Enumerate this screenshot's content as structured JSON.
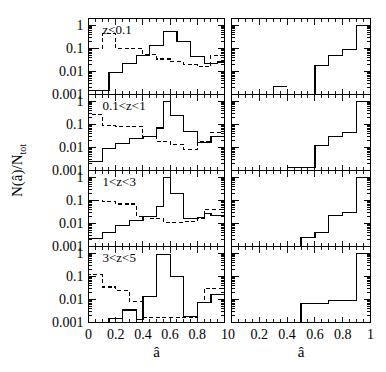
{
  "figure": {
    "xlabel_left": "â",
    "xlabel_right": "â",
    "ylabel": "N(â)/N",
    "ylabel_sub": "tot",
    "xticklabels": [
      "0",
      "0.2",
      "0.4",
      "0.6",
      "0.8",
      "1"
    ],
    "yticklabels": [
      "1",
      "0.1",
      "0.01",
      "0.001"
    ],
    "line_color": "#000000"
  },
  "chart_data": {
    "type": "line",
    "title": "",
    "xlabel": "â",
    "ylabel": "N(â)/N_tot",
    "xlim": [
      0,
      1
    ],
    "ylim": [
      0.001,
      2
    ],
    "yscale": "log",
    "grid": false,
    "legend": "none",
    "panels": [
      {
        "row": 0,
        "label": "z<0.1",
        "left": {
          "bin_edges": [
            0,
            0.05,
            0.1,
            0.15,
            0.2,
            0.25,
            0.3,
            0.35,
            0.4,
            0.45,
            0.5,
            0.55,
            0.6,
            0.65,
            0.7,
            0.75,
            0.8,
            0.85,
            0.9,
            0.95,
            1.0
          ],
          "series": [
            {
              "name": "solid",
              "style": "solid",
              "values": [
                0.0015,
                0.0015,
                0.0015,
                0.009,
                0.009,
                0.022,
                0.022,
                0.05,
                0.05,
                0.13,
                0.13,
                0.55,
                0.55,
                0.2,
                0.2,
                0.045,
                0.045,
                0.022,
                0.022,
                0.026
              ]
            },
            {
              "name": "dashed",
              "style": "dashed",
              "values": [
                0.1,
                0.1,
                0.45,
                0.45,
                0.1,
                0.1,
                0.1,
                0.1,
                0.055,
                0.055,
                0.035,
                0.035,
                0.026,
                0.026,
                0.02,
                0.02,
                0.016,
                0.016,
                0.05,
                0.05
              ]
            }
          ]
        },
        "right": {
          "bin_edges": [
            0,
            0.1,
            0.2,
            0.3,
            0.4,
            0.5,
            0.6,
            0.7,
            0.8,
            0.9,
            1.0
          ],
          "series": [
            {
              "name": "solid",
              "style": "solid",
              "values": [
                null,
                null,
                null,
                0.0022,
                null,
                null,
                0.018,
                0.05,
                0.09,
                1.0
              ]
            }
          ]
        }
      },
      {
        "row": 1,
        "label": "0.1<z<1",
        "left": {
          "bin_edges": [
            0,
            0.05,
            0.1,
            0.15,
            0.2,
            0.25,
            0.3,
            0.35,
            0.4,
            0.45,
            0.5,
            0.55,
            0.6,
            0.65,
            0.7,
            0.75,
            0.8,
            0.85,
            0.9,
            0.95,
            1.0
          ],
          "series": [
            {
              "name": "solid",
              "style": "solid",
              "values": [
                0.0025,
                0.0025,
                0.009,
                0.009,
                0.015,
                0.015,
                0.025,
                0.025,
                0.03,
                0.03,
                0.07,
                1.0,
                0.25,
                0.25,
                0.05,
                0.05,
                0.016,
                0.016,
                0.03,
                0.03
              ]
            },
            {
              "name": "dashed",
              "style": "dashed",
              "values": [
                0.28,
                0.28,
                0.09,
                0.09,
                0.085,
                0.085,
                0.085,
                0.085,
                0.03,
                0.03,
                0.018,
                0.018,
                0.013,
                0.013,
                0.008,
                0.008,
                0.018,
                0.018,
                0.045,
                0.045
              ]
            }
          ]
        },
        "right": {
          "bin_edges": [
            0,
            0.1,
            0.2,
            0.3,
            0.4,
            0.5,
            0.6,
            0.7,
            0.8,
            0.9,
            1.0
          ],
          "series": [
            {
              "name": "solid",
              "style": "solid",
              "values": [
                null,
                null,
                null,
                null,
                0.0013,
                0.0013,
                0.012,
                0.03,
                0.045,
                1.0
              ]
            }
          ]
        }
      },
      {
        "row": 2,
        "label": "1<z<3",
        "left": {
          "bin_edges": [
            0,
            0.05,
            0.1,
            0.15,
            0.2,
            0.25,
            0.3,
            0.35,
            0.4,
            0.45,
            0.5,
            0.55,
            0.6,
            0.65,
            0.7,
            0.75,
            0.8,
            0.85,
            0.9,
            0.95,
            1.0
          ],
          "series": [
            {
              "name": "solid",
              "style": "solid",
              "values": [
                0.0022,
                0.0022,
                0.004,
                0.004,
                0.008,
                0.008,
                0.013,
                0.013,
                0.02,
                0.02,
                0.055,
                1.0,
                0.2,
                0.2,
                0.017,
                0.017,
                0.018,
                0.027,
                0.022,
                0.022
              ]
            },
            {
              "name": "dashed",
              "style": "dashed",
              "values": [
                0.1,
                0.1,
                0.09,
                0.09,
                0.07,
                0.07,
                0.07,
                0.02,
                0.02,
                0.016,
                0.016,
                0.011,
                0.011,
                0.011,
                0.012,
                0.012,
                0.016,
                0.04,
                0.04,
                0.04
              ]
            }
          ]
        },
        "right": {
          "bin_edges": [
            0,
            0.1,
            0.2,
            0.3,
            0.4,
            0.5,
            0.6,
            0.7,
            0.8,
            0.9,
            1.0
          ],
          "series": [
            {
              "name": "solid",
              "style": "solid",
              "values": [
                null,
                null,
                null,
                null,
                null,
                0.0025,
                0.004,
                0.022,
                0.03,
                1.0
              ]
            }
          ]
        }
      },
      {
        "row": 3,
        "label": "3<z<5",
        "left": {
          "bin_edges": [
            0,
            0.05,
            0.1,
            0.15,
            0.2,
            0.25,
            0.3,
            0.35,
            0.4,
            0.45,
            0.5,
            0.55,
            0.6,
            0.65,
            0.7,
            0.75,
            0.8,
            0.85,
            0.9,
            0.95,
            1.0
          ],
          "series": [
            {
              "name": "solid",
              "style": "solid",
              "values": [
                null,
                null,
                null,
                0.0015,
                0.0015,
                0.0035,
                0.0035,
                0.0014,
                0.014,
                0.014,
                0.9,
                0.9,
                0.1,
                0.1,
                0.0018,
                0.0018,
                0.0075,
                0.0075,
                0.016,
                0.016
              ]
            },
            {
              "name": "dashed",
              "style": "dashed",
              "values": [
                0.12,
                0.12,
                0.035,
                0.035,
                0.025,
                0.025,
                0.0085,
                0.0085,
                0.0016,
                0.0016,
                0.0016,
                0.0016,
                0.0016,
                0.0016,
                0.0016,
                0.0016,
                0.0075,
                0.03,
                0.03,
                0.03
              ]
            }
          ]
        },
        "right": {
          "bin_edges": [
            0,
            0.1,
            0.2,
            0.3,
            0.4,
            0.5,
            0.6,
            0.7,
            0.8,
            0.9,
            1.0
          ],
          "series": [
            {
              "name": "solid",
              "style": "solid",
              "values": [
                null,
                null,
                null,
                null,
                null,
                0.0065,
                0.0065,
                0.009,
                0.009,
                1.0
              ]
            }
          ]
        }
      }
    ]
  }
}
